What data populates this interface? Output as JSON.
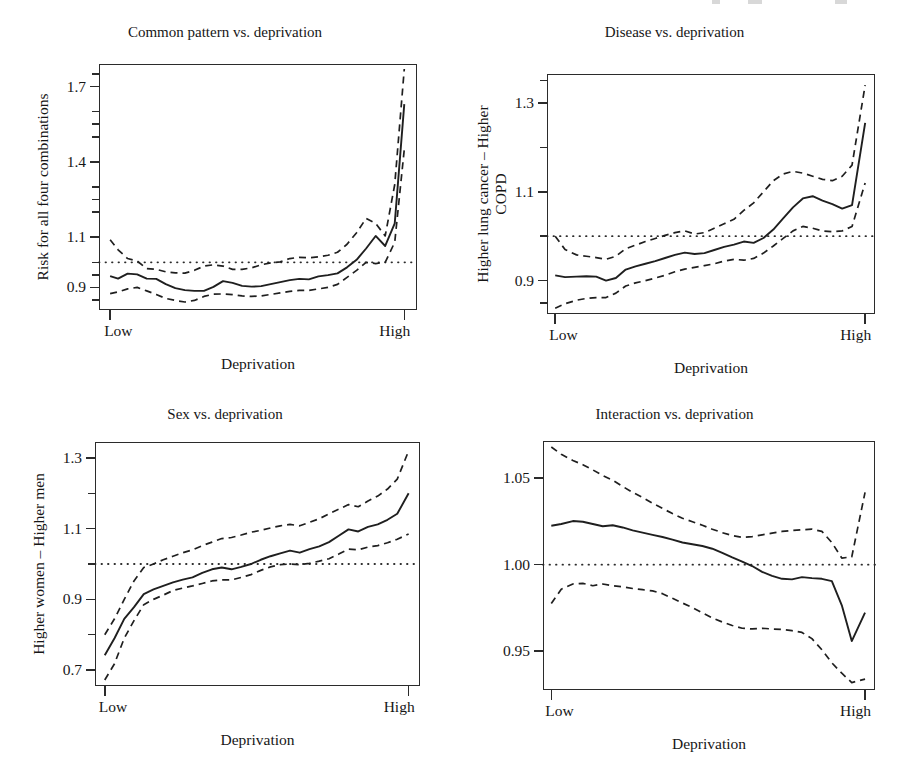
{
  "figure": {
    "background": "#ffffff",
    "ink": "#1a1a1a",
    "panel_count": 4,
    "shared_xlabel": "Deprivation",
    "shared_x_low": "Low",
    "shared_x_high": "High"
  },
  "chart_data": [
    {
      "id": "common-pattern",
      "type": "line",
      "title": "Common pattern vs. deprivation",
      "xlabel": "Deprivation",
      "ylabel": "Risk for all four combinations",
      "xlim": [
        0,
        100
      ],
      "ylim": [
        0.81,
        1.79
      ],
      "xtick_labels": [
        "Low",
        "High"
      ],
      "xtick_values": [
        3.5,
        96
      ],
      "ytick_labels": [
        "1.7",
        "1.4",
        "1.1",
        "0.9"
      ],
      "ytick_values": [
        1.7,
        1.4,
        1.1,
        0.9
      ],
      "minor_ytick_values": [
        1.75,
        1.6,
        1.55,
        1.5,
        1.3,
        1.25,
        1.2,
        1.0,
        0.95,
        0.85
      ],
      "grid": false,
      "legend": false,
      "reference_line": {
        "style": "dotted",
        "y": 1.0
      },
      "series": [
        {
          "name": "estimate",
          "style": "solid",
          "x": [
            3.5,
            6,
            9,
            12,
            15,
            18,
            21,
            24,
            27,
            30,
            33,
            36,
            39,
            42,
            45,
            48,
            51,
            54,
            57,
            60,
            63,
            66,
            69,
            72,
            75,
            78,
            81,
            84,
            87,
            90,
            93,
            96
          ],
          "values": [
            0.945,
            0.935,
            0.955,
            0.952,
            0.935,
            0.934,
            0.913,
            0.897,
            0.889,
            0.886,
            0.886,
            0.902,
            0.925,
            0.918,
            0.906,
            0.903,
            0.905,
            0.913,
            0.921,
            0.929,
            0.934,
            0.932,
            0.944,
            0.949,
            0.956,
            0.98,
            1.01,
            1.055,
            1.105,
            1.065,
            1.155,
            1.63
          ]
        },
        {
          "name": "upper-confidence-limit",
          "style": "dashed",
          "x": [
            3.5,
            6,
            9,
            12,
            15,
            18,
            21,
            24,
            27,
            30,
            33,
            36,
            39,
            42,
            45,
            48,
            51,
            54,
            57,
            60,
            63,
            66,
            69,
            72,
            75,
            78,
            81,
            84,
            87,
            90,
            93,
            96
          ],
          "values": [
            1.09,
            1.05,
            1.015,
            1.005,
            0.975,
            0.972,
            0.962,
            0.958,
            0.957,
            0.968,
            0.985,
            0.99,
            0.985,
            0.972,
            0.972,
            0.978,
            0.99,
            0.998,
            1.002,
            1.015,
            1.02,
            1.018,
            1.022,
            1.028,
            1.04,
            1.072,
            1.118,
            1.175,
            1.155,
            1.105,
            1.31,
            1.77
          ]
        },
        {
          "name": "lower-confidence-limit",
          "style": "dashed",
          "x": [
            3.5,
            6,
            9,
            12,
            15,
            18,
            21,
            24,
            27,
            30,
            33,
            36,
            39,
            42,
            45,
            48,
            51,
            54,
            57,
            60,
            63,
            66,
            69,
            72,
            75,
            78,
            81,
            84,
            87,
            90,
            93,
            96
          ],
          "values": [
            0.875,
            0.882,
            0.894,
            0.9,
            0.886,
            0.872,
            0.856,
            0.848,
            0.842,
            0.848,
            0.864,
            0.873,
            0.874,
            0.871,
            0.866,
            0.864,
            0.866,
            0.872,
            0.878,
            0.884,
            0.888,
            0.888,
            0.894,
            0.9,
            0.912,
            0.94,
            0.968,
            1.0,
            0.995,
            1.0,
            1.08,
            1.45
          ]
        }
      ]
    },
    {
      "id": "disease",
      "type": "line",
      "title": "Disease vs. deprivation",
      "xlabel": "Deprivation",
      "ylabel": "Higher lung cancer – Higher\nCOPD",
      "ylabel_line1": "Higher lung cancer – Higher",
      "ylabel_line2": "COPD",
      "xlim": [
        0,
        100
      ],
      "ylim": [
        0.825,
        1.365
      ],
      "xtick_labels": [
        "Low",
        "High"
      ],
      "xtick_values": [
        2.5,
        97
      ],
      "ytick_labels": [
        "1.3",
        "1.1",
        "0.9"
      ],
      "ytick_values": [
        1.3,
        1.1,
        0.9
      ],
      "minor_ytick_values": [
        1.35,
        1.2,
        1.0,
        0.85
      ],
      "grid": false,
      "legend": false,
      "reference_line": {
        "style": "dotted",
        "y": 1.0
      },
      "series": [
        {
          "name": "estimate",
          "style": "solid",
          "x": [
            2.5,
            5.5,
            9,
            12,
            15,
            18,
            21,
            24,
            27,
            30,
            33,
            36,
            39,
            42,
            45,
            48,
            51,
            54,
            57,
            60,
            63,
            66,
            69,
            72,
            75,
            78,
            81,
            84,
            87,
            90,
            93,
            97
          ],
          "values": [
            0.912,
            0.908,
            0.909,
            0.91,
            0.909,
            0.9,
            0.906,
            0.925,
            0.932,
            0.938,
            0.944,
            0.951,
            0.958,
            0.963,
            0.96,
            0.962,
            0.969,
            0.976,
            0.981,
            0.988,
            0.985,
            0.996,
            1.015,
            1.04,
            1.065,
            1.085,
            1.09,
            1.08,
            1.072,
            1.062,
            1.07,
            1.255
          ]
        },
        {
          "name": "upper-confidence-limit",
          "style": "dashed",
          "x": [
            2.5,
            5.5,
            9,
            12,
            15,
            18,
            21,
            24,
            27,
            30,
            33,
            36,
            39,
            42,
            45,
            48,
            51,
            54,
            57,
            60,
            63,
            66,
            69,
            72,
            75,
            78,
            81,
            84,
            87,
            90,
            93,
            97
          ],
          "values": [
            1.0,
            0.97,
            0.958,
            0.955,
            0.952,
            0.948,
            0.955,
            0.972,
            0.98,
            0.988,
            0.995,
            1.002,
            1.008,
            1.012,
            1.005,
            1.008,
            1.018,
            1.028,
            1.038,
            1.058,
            1.075,
            1.1,
            1.125,
            1.14,
            1.146,
            1.142,
            1.135,
            1.128,
            1.125,
            1.135,
            1.16,
            1.34
          ]
        },
        {
          "name": "lower-confidence-limit",
          "style": "dashed",
          "x": [
            2.5,
            5.5,
            9,
            12,
            15,
            18,
            21,
            24,
            27,
            30,
            33,
            36,
            39,
            42,
            45,
            48,
            51,
            54,
            57,
            60,
            63,
            66,
            69,
            72,
            75,
            78,
            81,
            84,
            87,
            90,
            93,
            97
          ],
          "values": [
            0.838,
            0.848,
            0.856,
            0.86,
            0.862,
            0.862,
            0.872,
            0.888,
            0.895,
            0.9,
            0.906,
            0.912,
            0.92,
            0.926,
            0.93,
            0.934,
            0.938,
            0.944,
            0.948,
            0.946,
            0.95,
            0.962,
            0.978,
            0.995,
            1.012,
            1.022,
            1.018,
            1.012,
            1.01,
            1.012,
            1.022,
            1.12
          ]
        }
      ]
    },
    {
      "id": "sex",
      "type": "line",
      "title": "Sex vs. deprivation",
      "xlabel": "Deprivation",
      "ylabel": "Higher women – Higher men",
      "xlim": [
        0,
        100
      ],
      "ylim": [
        0.655,
        1.345
      ],
      "xtick_labels": [
        "Low",
        "High"
      ],
      "xtick_values": [
        3,
        96.5
      ],
      "ytick_labels": [
        "1.3",
        "1.1",
        "0.9",
        "0.7"
      ],
      "ytick_values": [
        1.3,
        1.1,
        0.9,
        0.7
      ],
      "minor_ytick_values": [
        1.2,
        1.0,
        0.8
      ],
      "grid": false,
      "legend": false,
      "reference_line": {
        "style": "dotted",
        "y": 1.0
      },
      "series": [
        {
          "name": "estimate",
          "style": "solid",
          "x": [
            3,
            6,
            9,
            12,
            15,
            18,
            21,
            24,
            27,
            30,
            33,
            36,
            39,
            42,
            45,
            48,
            51,
            54,
            57,
            60,
            63,
            66,
            69,
            72,
            75,
            78,
            81,
            84,
            87,
            90,
            93,
            96.5
          ],
          "values": [
            0.742,
            0.79,
            0.845,
            0.878,
            0.915,
            0.928,
            0.938,
            0.948,
            0.956,
            0.962,
            0.975,
            0.985,
            0.99,
            0.985,
            0.992,
            1.0,
            1.012,
            1.022,
            1.03,
            1.038,
            1.032,
            1.042,
            1.05,
            1.062,
            1.08,
            1.098,
            1.092,
            1.105,
            1.112,
            1.125,
            1.142,
            1.2
          ]
        },
        {
          "name": "upper-confidence-limit",
          "style": "dashed",
          "x": [
            3,
            6,
            9,
            12,
            15,
            18,
            21,
            24,
            27,
            30,
            33,
            36,
            39,
            42,
            45,
            48,
            51,
            54,
            57,
            60,
            63,
            66,
            69,
            72,
            75,
            78,
            81,
            84,
            87,
            90,
            93,
            96.5
          ],
          "values": [
            0.8,
            0.845,
            0.9,
            0.952,
            0.99,
            1.0,
            1.012,
            1.022,
            1.032,
            1.04,
            1.052,
            1.062,
            1.072,
            1.075,
            1.082,
            1.09,
            1.095,
            1.102,
            1.108,
            1.112,
            1.108,
            1.118,
            1.128,
            1.142,
            1.155,
            1.168,
            1.162,
            1.178,
            1.192,
            1.212,
            1.24,
            1.32
          ]
        },
        {
          "name": "lower-confidence-limit",
          "style": "dashed",
          "x": [
            3,
            6,
            9,
            12,
            15,
            18,
            21,
            24,
            27,
            30,
            33,
            36,
            39,
            42,
            45,
            48,
            51,
            54,
            57,
            60,
            63,
            66,
            69,
            72,
            75,
            78,
            81,
            84,
            87,
            90,
            93,
            96.5
          ],
          "values": [
            0.672,
            0.718,
            0.79,
            0.84,
            0.885,
            0.9,
            0.912,
            0.925,
            0.932,
            0.938,
            0.945,
            0.952,
            0.955,
            0.955,
            0.962,
            0.97,
            0.982,
            0.992,
            0.998,
            1.0,
            0.998,
            1.002,
            1.008,
            1.015,
            1.028,
            1.042,
            1.04,
            1.048,
            1.052,
            1.06,
            1.07,
            1.085
          ]
        }
      ]
    },
    {
      "id": "interaction",
      "type": "line",
      "title": "Interaction vs. deprivation",
      "xlabel": "Deprivation",
      "ylabel": "",
      "xlim": [
        0,
        100
      ],
      "ylim": [
        0.9275,
        1.0715
      ],
      "xtick_labels": [
        "Low",
        "High"
      ],
      "xtick_values": [
        2.5,
        97
      ],
      "ytick_labels": [
        "1.05",
        "1.00",
        "0.95"
      ],
      "ytick_values": [
        1.05,
        1.0,
        0.95
      ],
      "minor_ytick_values": [],
      "grid": false,
      "legend": false,
      "reference_line": {
        "style": "dotted",
        "y": 1.0
      },
      "series": [
        {
          "name": "estimate",
          "style": "solid",
          "x": [
            2.5,
            5.5,
            9,
            12,
            15,
            18,
            21,
            24,
            27,
            30,
            33,
            36,
            39,
            42,
            45,
            48,
            51,
            54,
            57,
            60,
            63,
            66,
            69,
            72,
            75,
            78,
            81,
            84,
            87,
            90,
            93,
            97
          ],
          "values": [
            1.0225,
            1.0235,
            1.0252,
            1.0248,
            1.0235,
            1.0222,
            1.0228,
            1.0215,
            1.0198,
            1.0185,
            1.0172,
            1.016,
            1.0145,
            1.0128,
            1.0118,
            1.0108,
            1.0092,
            1.0068,
            1.0042,
            1.0018,
            0.9992,
            0.9958,
            0.9935,
            0.9918,
            0.9915,
            0.9928,
            0.9922,
            0.9918,
            0.9905,
            0.9765,
            0.9558,
            0.9722
          ]
        },
        {
          "name": "upper-confidence-limit",
          "style": "dashed",
          "x": [
            2.5,
            5.5,
            9,
            12,
            15,
            18,
            21,
            24,
            27,
            30,
            33,
            36,
            39,
            42,
            45,
            48,
            51,
            54,
            57,
            60,
            63,
            66,
            69,
            72,
            75,
            78,
            81,
            84,
            87,
            90,
            93,
            97
          ],
          "values": [
            1.068,
            1.0638,
            1.0602,
            1.0578,
            1.0548,
            1.0515,
            1.0488,
            1.0452,
            1.0418,
            1.0388,
            1.0355,
            1.0325,
            1.0295,
            1.0268,
            1.0248,
            1.0228,
            1.0205,
            1.0185,
            1.0168,
            1.0158,
            1.0162,
            1.0172,
            1.0182,
            1.0192,
            1.0198,
            1.0202,
            1.0205,
            1.0192,
            1.0128,
            1.0038,
            1.0045,
            1.0418
          ]
        },
        {
          "name": "lower-confidence-limit",
          "style": "dashed",
          "x": [
            2.5,
            5.5,
            9,
            12,
            15,
            18,
            21,
            24,
            27,
            30,
            33,
            36,
            39,
            42,
            45,
            48,
            51,
            54,
            57,
            60,
            63,
            66,
            69,
            72,
            75,
            78,
            81,
            84,
            87,
            90,
            93,
            97
          ],
          "values": [
            0.9775,
            0.9858,
            0.9888,
            0.9892,
            0.9878,
            0.9888,
            0.9878,
            0.9872,
            0.9862,
            0.9855,
            0.9848,
            0.9832,
            0.9805,
            0.9778,
            0.9752,
            0.9722,
            0.9692,
            0.9668,
            0.9648,
            0.9632,
            0.9628,
            0.9632,
            0.9628,
            0.9625,
            0.9618,
            0.9608,
            0.9572,
            0.9508,
            0.9432,
            0.9372,
            0.9318,
            0.9338
          ]
        }
      ]
    }
  ]
}
